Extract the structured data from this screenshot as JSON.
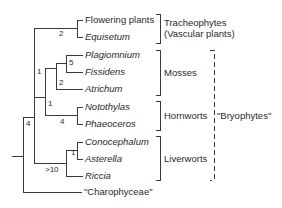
{
  "diagram": {
    "type": "phylogenetic-tree",
    "taxa": [
      {
        "label": "Flowering plants",
        "italic": false
      },
      {
        "label": "Equisetum",
        "italic": true
      },
      {
        "label": "Plagiomnium",
        "italic": true
      },
      {
        "label": "Fissidens",
        "italic": true
      },
      {
        "label": "Atrichum",
        "italic": true
      },
      {
        "label": "Notothylas",
        "italic": true
      },
      {
        "label": "Phaeoceros",
        "italic": true
      },
      {
        "label": "Conocephalum",
        "italic": true
      },
      {
        "label": "Asterella",
        "italic": true
      },
      {
        "label": "Riccia",
        "italic": true
      },
      {
        "label": "\"Charophyceae\"",
        "italic": false
      }
    ],
    "support_values": {
      "tracheophytes": "2",
      "plagiomnium_fissidens": "5",
      "mosses": "2",
      "mosses_hornworts": "1",
      "hornworts": "4",
      "land_plants_minus_liverworts": "1",
      "liverworts": ">10",
      "conocephalum_asterella": "1",
      "root": "4"
    },
    "groups": {
      "tracheophytes_line1": "Tracheophytes",
      "tracheophytes_line2": "(Vascular plants)",
      "mosses": "Mosses",
      "hornworts": "Hornworts",
      "liverworts": "Liverworts",
      "bryophytes": "\"Bryophytes\""
    }
  }
}
